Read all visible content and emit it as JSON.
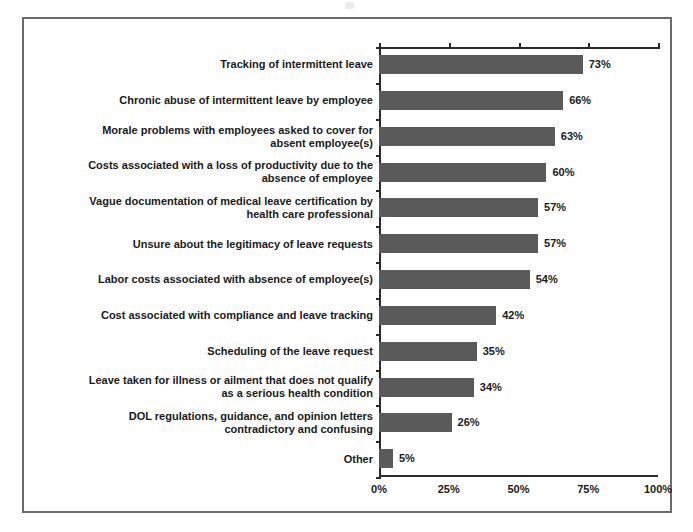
{
  "chart_data": {
    "type": "bar",
    "orientation": "horizontal",
    "title": "",
    "subtitle": "",
    "xlabel": "",
    "ylabel": "",
    "xlim": [
      0,
      100
    ],
    "grid": false,
    "legend": null,
    "xticks": [
      "0%",
      "25%",
      "50%",
      "75%",
      "100%"
    ],
    "xtick_values": [
      0,
      25,
      50,
      75,
      100
    ],
    "bar_color": "#5a5a5a",
    "axis_color": "#2b2b2b",
    "frame_color": "#6b6b6b",
    "background": "#ffffff",
    "categories": [
      "Tracking of intermittent leave",
      "Chronic abuse of intermittent leave by employee",
      "Morale problems with employees asked to cover for absent employee(s)",
      "Costs associated with a loss of productivity due to the absence of employee",
      "Vague documentation of medical leave certification by health care professional",
      "Unsure about the legitimacy of leave requests",
      "Labor costs associated with absence of employee(s)",
      "Cost associated with compliance and leave tracking",
      "Scheduling of the leave request",
      "Leave taken for illness or ailment that does not qualify as a serious health condition",
      "DOL regulations, guidance, and opinion letters contradictory and confusing",
      "Other"
    ],
    "values": [
      73,
      66,
      63,
      60,
      57,
      57,
      54,
      42,
      35,
      34,
      26,
      5
    ],
    "value_labels": [
      "73%",
      "66%",
      "63%",
      "60%",
      "57%",
      "57%",
      "54%",
      "42%",
      "35%",
      "34%",
      "26%",
      "5%"
    ]
  }
}
